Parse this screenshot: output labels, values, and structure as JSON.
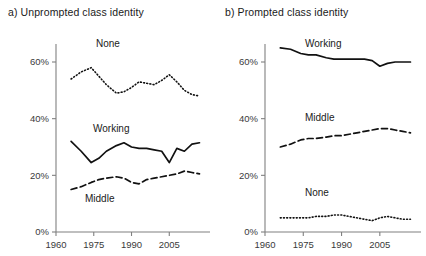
{
  "figure": {
    "panels": [
      {
        "id": "a",
        "title": "a) Unprompted class identity",
        "series_labels": {
          "none": "None",
          "working": "Working",
          "middle": "Middle"
        }
      },
      {
        "id": "b",
        "title": "b) Prompted class identity",
        "series_labels": {
          "working": "Working",
          "middle": "Middle",
          "none": "None"
        }
      }
    ],
    "axis": {
      "ytick_labels": [
        "60%",
        "40%",
        "20%",
        "0%"
      ],
      "xtick_labels": [
        "1960",
        "1975",
        "1990",
        "2005"
      ]
    },
    "colors": {
      "line": "#111111",
      "axis": "#808080",
      "text": "#1a1a1a",
      "tick_text": "#3a3a3a",
      "background": "#ffffff"
    }
  },
  "chart_data": [
    {
      "type": "line",
      "title": "a) Unprompted class identity",
      "xlabel": "",
      "ylabel": "",
      "xlim": [
        1960,
        2018
      ],
      "ylim": [
        0,
        70
      ],
      "xticks": [
        1960,
        1975,
        1990,
        2005
      ],
      "yticks": [
        0,
        20,
        40,
        60
      ],
      "ytick_labels": [
        "0%",
        "20%",
        "40%",
        "60%"
      ],
      "grid": false,
      "legend": "inline-labels",
      "series": [
        {
          "name": "None",
          "style": "dotted",
          "x": [
            1966,
            1970,
            1974,
            1977,
            1980,
            1984,
            1987,
            1990,
            1993,
            1996,
            1999,
            2002,
            2005,
            2008,
            2011,
            2014,
            2017
          ],
          "values": [
            54,
            56.5,
            58,
            55,
            52,
            49,
            49.5,
            51,
            53,
            52.5,
            52,
            53.5,
            55.5,
            53,
            50,
            48.5,
            48
          ]
        },
        {
          "name": "Working",
          "style": "solid",
          "x": [
            1966,
            1970,
            1974,
            1977,
            1980,
            1984,
            1987,
            1990,
            1993,
            1996,
            1999,
            2002,
            2005,
            2008,
            2011,
            2014,
            2017
          ],
          "values": [
            32,
            28.5,
            24.5,
            26,
            28.5,
            30.5,
            31.5,
            30,
            29.5,
            29.5,
            29,
            28.5,
            24.5,
            29.5,
            28.5,
            31,
            31.5
          ]
        },
        {
          "name": "Middle",
          "style": "dashed",
          "x": [
            1966,
            1970,
            1974,
            1977,
            1980,
            1984,
            1987,
            1990,
            1993,
            1996,
            1999,
            2002,
            2005,
            2008,
            2011,
            2014,
            2017
          ],
          "values": [
            15,
            16,
            17.5,
            18.5,
            19,
            19.5,
            19,
            17.5,
            17,
            18.5,
            19,
            19.5,
            20,
            20.5,
            21.5,
            21,
            20.5
          ]
        }
      ]
    },
    {
      "type": "line",
      "title": "b) Prompted class identity",
      "xlabel": "",
      "ylabel": "",
      "xlim": [
        1960,
        2018
      ],
      "ylim": [
        0,
        70
      ],
      "xticks": [
        1960,
        1975,
        1990,
        2005
      ],
      "yticks": [
        0,
        20,
        40,
        60
      ],
      "ytick_labels": [
        "0%",
        "20%",
        "40%",
        "60%"
      ],
      "grid": false,
      "legend": "inline-labels",
      "series": [
        {
          "name": "Working",
          "style": "solid",
          "x": [
            1966,
            1970,
            1974,
            1977,
            1980,
            1984,
            1987,
            1990,
            1993,
            1996,
            1999,
            2002,
            2005,
            2008,
            2011,
            2014,
            2017
          ],
          "values": [
            65,
            64.5,
            63,
            62.5,
            62.5,
            61.5,
            61,
            61,
            61,
            61,
            61,
            60.5,
            58.5,
            59.5,
            60,
            60,
            60
          ]
        },
        {
          "name": "Middle",
          "style": "dashed",
          "x": [
            1966,
            1970,
            1974,
            1977,
            1980,
            1984,
            1987,
            1990,
            1993,
            1996,
            1999,
            2002,
            2005,
            2008,
            2011,
            2014,
            2017
          ],
          "values": [
            30,
            31,
            32.5,
            33,
            33,
            33.5,
            34,
            34,
            34.5,
            35,
            35.5,
            36,
            36.5,
            36.5,
            36,
            35.5,
            35
          ]
        },
        {
          "name": "None",
          "style": "dotted",
          "x": [
            1966,
            1970,
            1974,
            1977,
            1980,
            1984,
            1987,
            1990,
            1993,
            1996,
            1999,
            2002,
            2005,
            2008,
            2011,
            2014,
            2017
          ],
          "values": [
            5,
            5,
            5,
            5,
            5.5,
            5.5,
            6,
            6,
            5.5,
            5,
            4.5,
            4,
            5,
            5.5,
            5,
            4.5,
            4.5
          ]
        }
      ]
    }
  ],
  "series_label_positions": {
    "a": {
      "None": {
        "x": 96,
        "y": 47
      },
      "Working": {
        "x": 93,
        "y": 132
      },
      "Middle": {
        "x": 85,
        "y": 202
      }
    },
    "b": {
      "Working": {
        "x": 305,
        "y": 47
      },
      "Middle": {
        "x": 305,
        "y": 121
      },
      "None": {
        "x": 305,
        "y": 196
      }
    }
  }
}
